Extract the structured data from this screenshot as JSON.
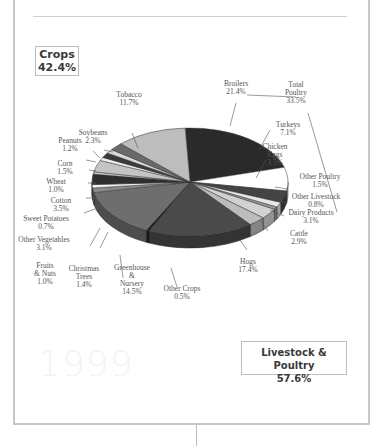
{
  "frame": {
    "year_watermark": "1999"
  },
  "summary": {
    "crops": {
      "label": "Crops",
      "value": "42.4%"
    },
    "livestock": {
      "label": "Livestock & Poultry",
      "value": "57.6%"
    }
  },
  "labels": {
    "broilers": [
      "Broilers",
      "21.4%"
    ],
    "total_poultry": [
      "Total",
      "Poultry",
      "33.5%"
    ],
    "turkeys": [
      "Turkeys",
      "7.1%"
    ],
    "chicken_eggs": [
      "Chicken",
      "Eggs",
      "3.5%"
    ],
    "other_poultry": [
      "Other Poultry",
      "1.5%"
    ],
    "other_livestock": [
      "Other Livestock",
      "0.8%"
    ],
    "dairy": [
      "Dairy Products",
      "3.1%"
    ],
    "cattle": [
      "Cattle",
      "2.9%"
    ],
    "hogs": [
      "Hogs",
      "17.4%"
    ],
    "other_crops": [
      "Other Crops",
      "0.5%"
    ],
    "greenhouse": [
      "Greenhouse",
      "&",
      "Nursery",
      "14.5%"
    ],
    "christmas": [
      "Christmas",
      "Trees",
      "1.4%"
    ],
    "fruits": [
      "Fruits",
      "& Nuts",
      "1.0%"
    ],
    "other_veg": [
      "Other Vegetables",
      "3.1%"
    ],
    "sweet_potatoes": [
      "Sweet Potatoes",
      "0.7%"
    ],
    "cotton": [
      "Cotton",
      "3.5%"
    ],
    "wheat": [
      "Wheat",
      "1.0%"
    ],
    "corn": [
      "Corn",
      "1.5%"
    ],
    "peanuts": [
      "Peanuts",
      "1.2%"
    ],
    "soybeans": [
      "Soybeans",
      "2.3%"
    ],
    "tobacco": [
      "Tobacco",
      "11.7%"
    ]
  },
  "chart_data": {
    "type": "pie",
    "title": "1999",
    "style": "3d-exploded-tilted",
    "groups": [
      {
        "name": "Crops",
        "value": 42.4
      },
      {
        "name": "Livestock & Poultry",
        "value": 57.6
      },
      {
        "name": "Total Poultry",
        "value": 33.5
      }
    ],
    "categories": [
      "Broilers",
      "Turkeys",
      "Chicken Eggs",
      "Other Poultry",
      "Other Livestock",
      "Dairy Products",
      "Cattle",
      "Hogs",
      "Other Crops",
      "Greenhouse & Nursery",
      "Christmas Trees",
      "Fruits & Nuts",
      "Other Vegetables",
      "Sweet Potatoes",
      "Cotton",
      "Wheat",
      "Corn",
      "Peanuts",
      "Soybeans",
      "Tobacco"
    ],
    "values": [
      21.4,
      7.1,
      3.5,
      1.5,
      0.8,
      3.1,
      2.9,
      17.4,
      0.5,
      14.5,
      1.4,
      1.0,
      3.1,
      0.7,
      3.5,
      1.0,
      1.5,
      1.2,
      2.3,
      11.7
    ],
    "colors": [
      "#2a2a2a",
      "#ffffff",
      "#444444",
      "#e8e8e8",
      "#9a9a9a",
      "#d2d2d2",
      "#bcbcbc",
      "#4a4a4a",
      "#1e1e1e",
      "#6e6e6e",
      "#8a8a8a",
      "#f2f2f2",
      "#2e2e2e",
      "#cfcfcf",
      "#c4c4c4",
      "#eeeeee",
      "#3a3a3a",
      "#dadada",
      "#6a6a6a",
      "#bdbdbd"
    ],
    "legend": "none (callout labels)"
  }
}
